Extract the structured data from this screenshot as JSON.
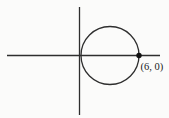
{
  "diagram": {
    "type": "coordinate-plane-with-circle",
    "point_label": "(6, 0)",
    "point": {
      "x": 6,
      "y": 0
    },
    "circle": {
      "center_x": 3,
      "center_y": 0,
      "radius": 3
    },
    "colors": {
      "line": "#2e2e2e",
      "point_fill": "#111111",
      "text": "#1a1a1a",
      "background": "#fbfbfa"
    }
  }
}
